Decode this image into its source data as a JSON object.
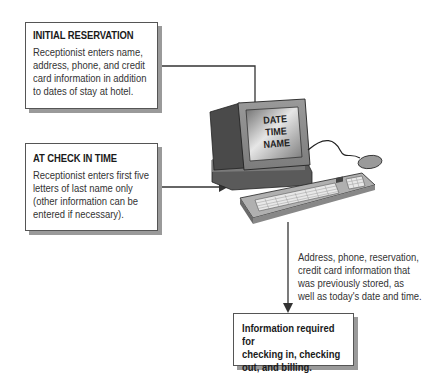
{
  "boxes": {
    "initial_reservation": {
      "title": "INITIAL RESERVATION",
      "lines": [
        "Receptionist enters name,",
        "address, phone, and credit",
        "card information in addition",
        "to dates of stay at hotel."
      ]
    },
    "check_in": {
      "title": "AT CHECK IN TIME",
      "lines": [
        "Receptionist enters first five",
        "letters of last name only",
        "(other information can be",
        "entered if necessary)."
      ]
    },
    "output": {
      "lines": [
        "Information required for",
        "checking in, checking",
        "out, and billing."
      ]
    }
  },
  "computer": {
    "screen_lines": [
      "DATE",
      "TIME",
      "NAME"
    ]
  },
  "annotation": {
    "lines": [
      "Address, phone, reservation,",
      "credit card information that",
      "was previously stored, as",
      "well as today's date and time."
    ]
  },
  "colors": {
    "line": "#333333",
    "shadow": "#9a9a9a",
    "monitor_dark": "#4a4a4a",
    "monitor_mid": "#8a8a8a",
    "keyboard": "#bdbdbd"
  }
}
